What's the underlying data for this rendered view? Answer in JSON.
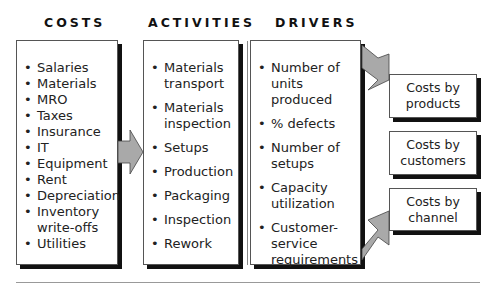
{
  "headings": {
    "costs": "COSTS",
    "activities": "ACTIVITIES",
    "drivers": "DRIVERS"
  },
  "costs": {
    "items": [
      "Salaries",
      "Materials",
      "MRO",
      "Taxes",
      "Insurance",
      "IT",
      "Equipment",
      "Rent",
      "Depreciation",
      "Inventory write-offs",
      "Utilities"
    ]
  },
  "activities": {
    "items": [
      "Materials transport",
      "Materials inspection",
      "Setups",
      "Production",
      "Packaging",
      "Inspection",
      "Rework"
    ]
  },
  "drivers": {
    "items": [
      "Number of units produced",
      "% defects",
      "Number of setups",
      "Capacity utilization",
      "Customer-service requirements"
    ]
  },
  "outputs": [
    {
      "label": "Costs by products"
    },
    {
      "label": "Costs by customers"
    },
    {
      "label": "Costs by channel"
    }
  ],
  "colors": {
    "arrow_fill": "#a9a9a9",
    "shadow": "#111111",
    "border": "#555555"
  }
}
